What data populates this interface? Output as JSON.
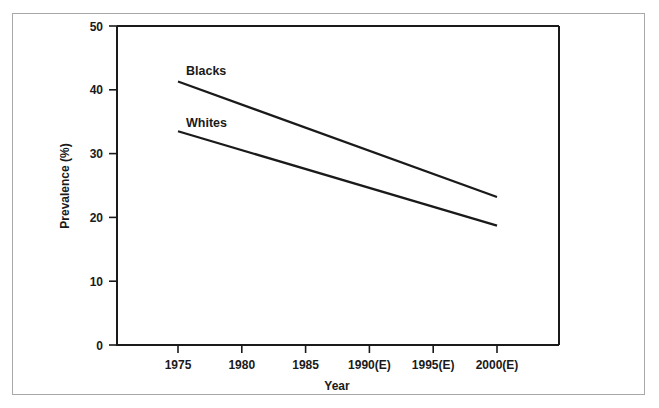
{
  "chart_data": {
    "type": "line",
    "title": "",
    "xlabel": "Year",
    "ylabel": "Prevalence (%)",
    "x": [
      1975,
      2000
    ],
    "categories": [
      "1975",
      "1980",
      "1985",
      "1990(E)",
      "1995(E)",
      "2000(E)"
    ],
    "xtick_labels": [
      "1975",
      "1980",
      "1985",
      "1990(E)",
      "1995(E)",
      "2000(E)"
    ],
    "ytick_labels": [
      "0",
      "10",
      "20",
      "30",
      "40",
      "50"
    ],
    "ytick_values": [
      0,
      10,
      20,
      30,
      40,
      50
    ],
    "xlim": [
      1975,
      2000
    ],
    "ylim": [
      0,
      50
    ],
    "grid": false,
    "legend_position": "inline-labels",
    "series": [
      {
        "name": "Blacks",
        "label": "Blacks",
        "x": [
          1975,
          2000
        ],
        "values": [
          41.3,
          23.2
        ],
        "color": "#1a1a1a"
      },
      {
        "name": "Whites",
        "label": "Whites",
        "x": [
          1975,
          2000
        ],
        "values": [
          33.5,
          18.7
        ],
        "color": "#1a1a1a"
      }
    ]
  },
  "figure": {
    "frame_color": "#a8a8a8",
    "background": "#ffffff",
    "axis_color": "#1a1a1a"
  }
}
